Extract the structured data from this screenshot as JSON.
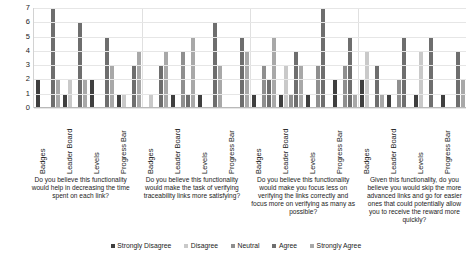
{
  "chart_data": {
    "type": "bar",
    "title": "",
    "xlabel": "",
    "ylabel": "",
    "ylim": [
      0,
      7
    ],
    "yticks": [
      0,
      1,
      2,
      3,
      4,
      5,
      6,
      7
    ],
    "grid": true,
    "legend_position": "bottom",
    "categories": [
      "Badges",
      "Leader Board",
      "Levels",
      "Progress Bar"
    ],
    "series": [
      {
        "name": "Strongly Disagree",
        "color": "#3f3f3f"
      },
      {
        "name": "Disagree",
        "color": "#c9c9c9"
      },
      {
        "name": "Neutral",
        "color": "#8f8f8f"
      },
      {
        "name": "Agree",
        "color": "#6e6e6e"
      },
      {
        "name": "Strongly Agree",
        "color": "#a8a8a8"
      }
    ],
    "groups": [
      {
        "question": "Do you believe this functionality would help in decreasing the time spent on each link?",
        "clusters": [
          {
            "category": "Badges",
            "values": [
              2,
              0,
              0,
              7,
              2
            ]
          },
          {
            "category": "Leader Board",
            "values": [
              1,
              2,
              0,
              6,
              2
            ]
          },
          {
            "category": "Levels",
            "values": [
              2,
              0,
              0,
              5,
              3
            ]
          },
          {
            "category": "Progress Bar",
            "values": [
              1,
              1,
              0,
              3,
              4
            ]
          }
        ]
      },
      {
        "question": "Do you believe this functionality would make the task of verifying traceability links more satisfying?",
        "clusters": [
          {
            "category": "Badges",
            "values": [
              0,
              1,
              0,
              3,
              4
            ]
          },
          {
            "category": "Leader Board",
            "values": [
              1,
              0,
              4,
              1,
              5
            ]
          },
          {
            "category": "Levels",
            "values": [
              1,
              0,
              0,
              6,
              3
            ]
          },
          {
            "category": "Progress Bar",
            "values": [
              0,
              0,
              0,
              5,
              4
            ]
          }
        ]
      },
      {
        "question": "Do you believe this functionality would make you focus less on verifying the links correctly and focus more on verifying as many as possible?",
        "clusters": [
          {
            "category": "Badges",
            "values": [
              1,
              0,
              3,
              2,
              5
            ]
          },
          {
            "category": "Leader Board",
            "values": [
              1,
              3,
              1,
              4,
              3
            ]
          },
          {
            "category": "Levels",
            "values": [
              1,
              0,
              3,
              7,
              0
            ]
          },
          {
            "category": "Progress Bar",
            "values": [
              2,
              0,
              3,
              5,
              1
            ]
          }
        ]
      },
      {
        "question": "Given this functionality, do you believe you would skip the more advanced links and go for easier ones that could potentially allow you to receive the reward more quickly?",
        "clusters": [
          {
            "category": "Badges",
            "values": [
              2,
              4,
              0,
              3,
              1
            ]
          },
          {
            "category": "Leader Board",
            "values": [
              1,
              0,
              2,
              5,
              0
            ]
          },
          {
            "category": "Levels",
            "values": [
              1,
              4,
              0,
              5,
              0
            ]
          },
          {
            "category": "Progress Bar",
            "values": [
              1,
              0,
              0,
              4,
              2
            ]
          }
        ]
      }
    ]
  }
}
